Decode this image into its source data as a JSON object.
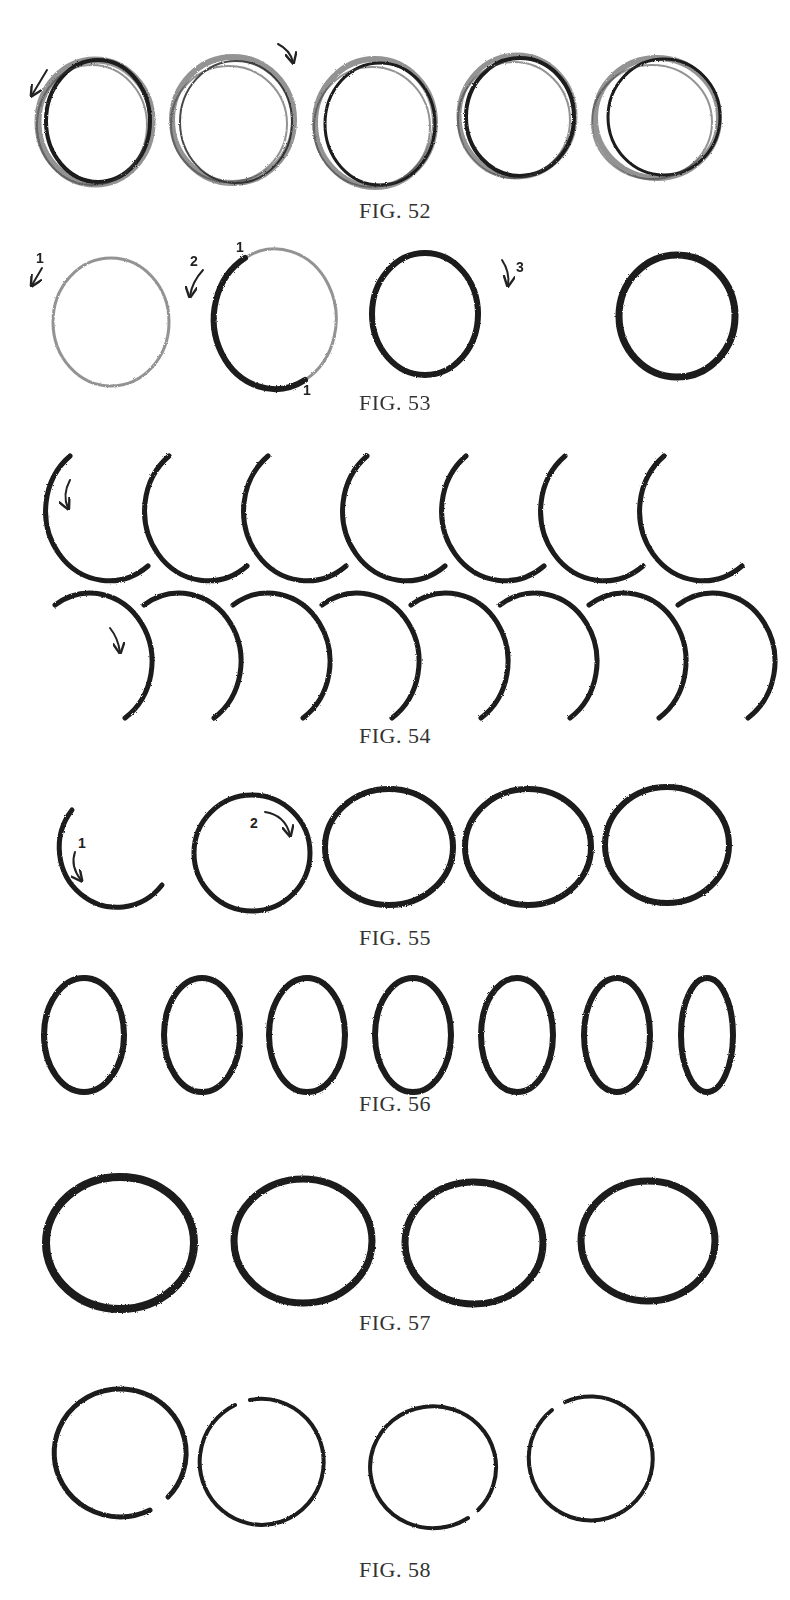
{
  "figures": [
    {
      "id": "fig-52",
      "caption": "Fig. 52",
      "description": "Five loosely sketched circles with multiple overlapping strokes; first has counter-clockwise arrow, second has clockwise arrow",
      "items": [
        {
          "kind": "sketchy-circle",
          "direction_arrow": "counter-clockwise"
        },
        {
          "kind": "sketchy-circle",
          "direction_arrow": "clockwise"
        },
        {
          "kind": "sketchy-circle"
        },
        {
          "kind": "sketchy-circle"
        },
        {
          "kind": "sketchy-circle"
        }
      ]
    },
    {
      "id": "fig-53",
      "caption": "Fig. 53",
      "description": "Step-by-step circle: light sketch, then darkened in two halves, final bold circle",
      "items": [
        {
          "kind": "light-circle",
          "step_label": "1"
        },
        {
          "kind": "half-darkened-circle",
          "step_label": "2",
          "tick_labels": [
            "1",
            "1"
          ]
        },
        {
          "kind": "darkened-circle",
          "step_label": "3"
        },
        {
          "kind": "bold-circle"
        }
      ]
    },
    {
      "id": "fig-54",
      "caption": "Fig. 54",
      "description": "Practice arcs: top row left-side arcs (count 7), bottom row right-side arcs (count 8)",
      "rows": [
        {
          "kind": "left-arc",
          "count": 7
        },
        {
          "kind": "right-arc",
          "count": 8
        }
      ]
    },
    {
      "id": "fig-55",
      "caption": "Fig. 55",
      "description": "Circle built from two arcs: step 1 left arc, step 2 right arc joining, then three completed circles",
      "items": [
        {
          "kind": "arc",
          "step_label": "1"
        },
        {
          "kind": "joined-circle",
          "step_label": "2"
        },
        {
          "kind": "circle"
        },
        {
          "kind": "circle"
        },
        {
          "kind": "circle"
        }
      ]
    },
    {
      "id": "fig-56",
      "caption": "Fig. 56",
      "description": "Seven upright ellipses, progressively narrower",
      "count": 7
    },
    {
      "id": "fig-57",
      "caption": "Fig. 57",
      "description": "Four bold circles/ovals",
      "count": 4
    },
    {
      "id": "fig-58",
      "caption": "Fig. 58",
      "description": "Four thin circles with small gaps",
      "count": 4
    }
  ]
}
